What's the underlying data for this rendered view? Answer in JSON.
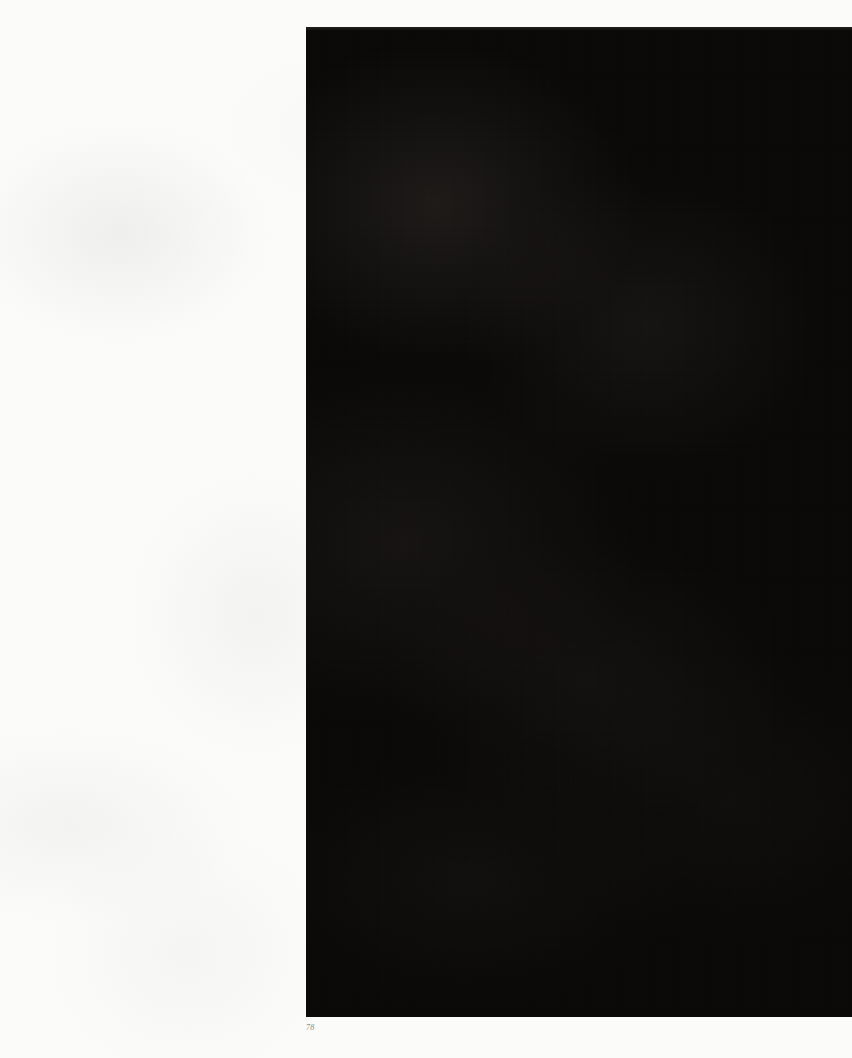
{
  "page": {
    "kind": "scanned-book-page",
    "folio": "78",
    "paper_color": "#fbfbfa",
    "width": 852,
    "height": 1058
  },
  "plate": {
    "label": "",
    "description": "",
    "caption": "",
    "fill_color": "#0a0908",
    "left": 306,
    "top": 27,
    "width": 546,
    "height": 990
  },
  "margin": {
    "label": "",
    "side": "left"
  }
}
